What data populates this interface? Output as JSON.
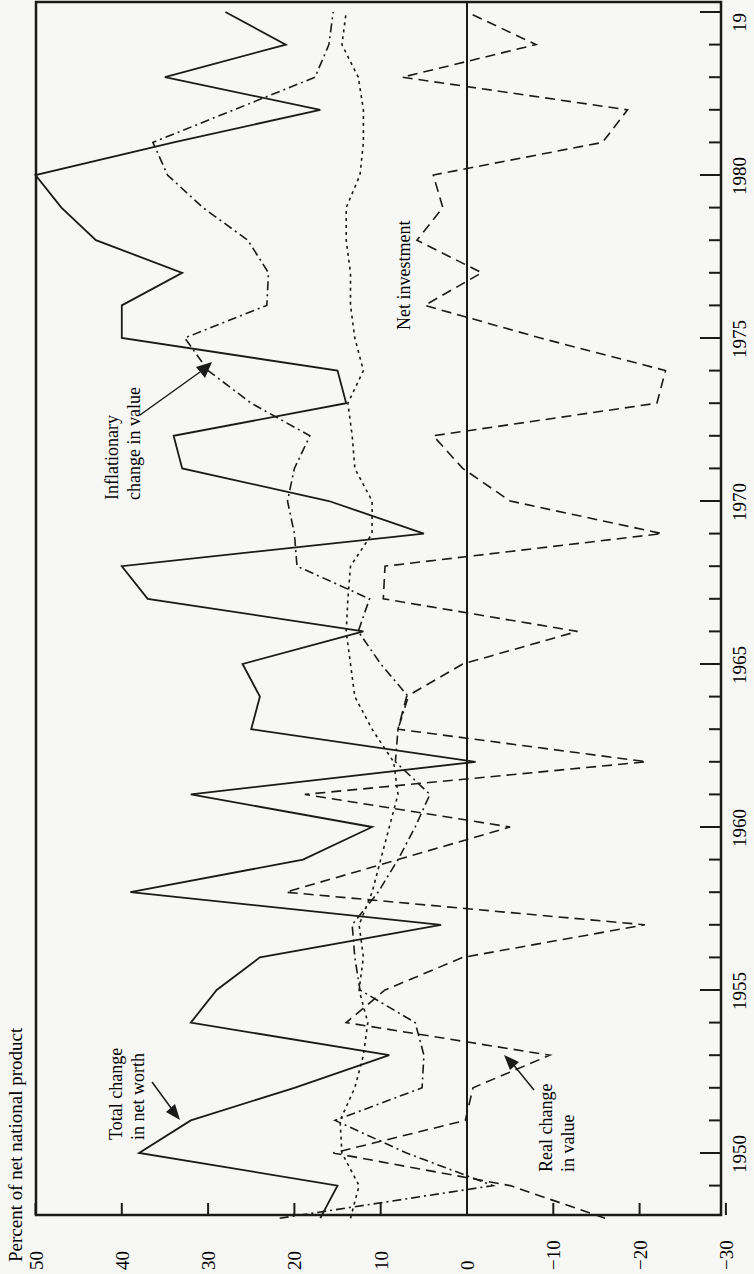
{
  "chart_data": {
    "type": "line",
    "title": "",
    "xlabel": "",
    "ylabel": "Percent of net national product",
    "orientation": "rotated-90 (years increase upward along right edge, values increase leftward)",
    "ylim": [
      -30,
      50
    ],
    "xlim": [
      1948,
      1985
    ],
    "yticks": [
      50,
      40,
      30,
      20,
      10,
      0,
      -10,
      -20,
      -30
    ],
    "ytick_labels": [
      "50",
      "40",
      "30",
      "20",
      "10",
      "0",
      "−10",
      "−20",
      "−30"
    ],
    "xticks": [
      1950,
      1955,
      1960,
      1965,
      1970,
      1975,
      1980,
      1985
    ],
    "xtick_labels": [
      "1950",
      "1955",
      "1960",
      "1965",
      "1970",
      "1975",
      "1980",
      "19"
    ],
    "grid": false,
    "zero_line": true,
    "x": [
      1948,
      1949,
      1950,
      1951,
      1952,
      1953,
      1954,
      1955,
      1956,
      1957,
      1958,
      1959,
      1960,
      1961,
      1962,
      1963,
      1964,
      1965,
      1966,
      1967,
      1968,
      1969,
      1970,
      1971,
      1972,
      1973,
      1974,
      1975,
      1976,
      1977,
      1978,
      1979,
      1980,
      1981,
      1982,
      1983,
      1984,
      1985
    ],
    "series": [
      {
        "name": "Total change in net worth",
        "style": "solid",
        "values": [
          17,
          15,
          38,
          32,
          20,
          9,
          32,
          29,
          24,
          3,
          39,
          19,
          11,
          32,
          -1,
          25,
          24,
          26,
          12,
          37,
          40,
          5,
          16,
          33,
          34,
          14,
          15,
          40,
          40,
          33,
          43,
          47,
          50,
          34,
          17,
          35,
          21,
          28
        ]
      },
      {
        "name": "Net investment",
        "style": "dotted",
        "values": [
          13.5,
          12.5,
          14.5,
          14.7,
          13,
          12,
          11.5,
          12.5,
          12,
          12.5,
          11,
          10,
          9,
          8,
          8.5,
          11,
          13,
          13.5,
          14,
          13.8,
          13.5,
          11,
          11,
          13,
          13.3,
          13.8,
          12,
          13,
          13.5,
          13.5,
          14,
          14,
          12.4,
          12,
          12,
          12.6,
          14.5,
          14
        ]
      },
      {
        "name": "Inflationary change in value",
        "style": "dash-dot",
        "values": [
          21.7,
          -3,
          7,
          15.3,
          5.2,
          5,
          6,
          12.4,
          13,
          13.3,
          10.3,
          8,
          6,
          4.3,
          8.3,
          8,
          6.8,
          10,
          12.6,
          11.3,
          19.7,
          20,
          20.8,
          20,
          18.2,
          25,
          30,
          32.7,
          23.2,
          23,
          25.4,
          30.6,
          34.7,
          36.4,
          27,
          17.6,
          16,
          15.5
        ]
      },
      {
        "name": "Real change in value",
        "style": "dashed",
        "values": [
          -16,
          -5,
          15.5,
          0.2,
          -0.7,
          -9.6,
          14,
          9.5,
          0.5,
          -20.6,
          21,
          8,
          -5,
          18.8,
          -20.8,
          8,
          7,
          0.5,
          -12.8,
          9.7,
          9.5,
          -22.6,
          -5,
          0.5,
          3.9,
          -22,
          -23,
          -8.5,
          4.9,
          -1.7,
          5.8,
          2.8,
          3.9,
          -15.7,
          -18.6,
          7.5,
          -8,
          0
        ]
      }
    ],
    "annotations": [
      {
        "text_lines": [
          "Total change",
          "in net worth"
        ],
        "points_to": "Total change in net worth",
        "near_year": 1951
      },
      {
        "text_lines": [
          "Real change",
          "in value"
        ],
        "points_to": "Real change in value",
        "near_year": 1953
      },
      {
        "text_lines": [
          "Inflationary",
          "change in value"
        ],
        "points_to": "Inflationary change in value",
        "near_year": 1974
      },
      {
        "text_lines": [
          "Net investment"
        ],
        "points_to": "Net investment",
        "near_year": 1977
      }
    ]
  }
}
